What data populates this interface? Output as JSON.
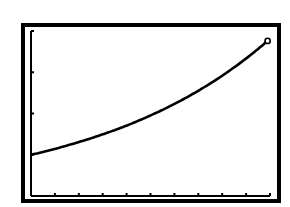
{
  "screen": {
    "type": "graphing-calculator-display",
    "frame_color": "#000000",
    "background_color": "#ffffff",
    "curve_color": "#000000"
  },
  "chart_data": {
    "type": "line",
    "title": "",
    "xlabel": "",
    "ylabel": "",
    "xlim": [
      0,
      10
    ],
    "ylim": [
      0,
      4
    ],
    "x_ticks": [
      1,
      2,
      3,
      4,
      5,
      6,
      7,
      8,
      9,
      10
    ],
    "y_ticks": [
      1,
      2,
      3,
      4
    ],
    "tick_labels_shown": false,
    "grid": false,
    "legend": null,
    "series": [
      {
        "name": "exponential growth curve",
        "x": [
          0,
          1,
          2,
          3,
          4,
          5,
          6,
          7,
          8,
          9,
          9.9
        ],
        "values": [
          1.0,
          1.14,
          1.31,
          1.49,
          1.71,
          1.95,
          2.23,
          2.55,
          2.91,
          3.33,
          3.76
        ],
        "endpoint_marker": "open-circle"
      }
    ]
  }
}
